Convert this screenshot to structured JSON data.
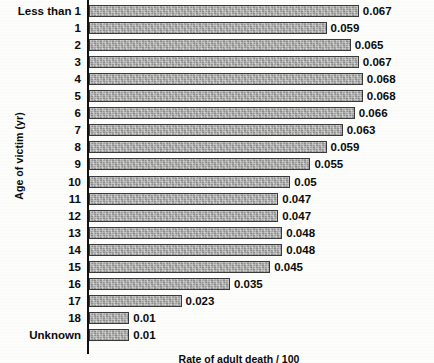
{
  "chart_data": {
    "type": "bar",
    "orientation": "horizontal",
    "title": "",
    "xlabel": "Rate of adult death / 100",
    "ylabel": "Age of victim (yr)",
    "categories": [
      "Less than 1",
      "1",
      "2",
      "3",
      "4",
      "5",
      "6",
      "7",
      "8",
      "9",
      "10",
      "11",
      "12",
      "13",
      "14",
      "15",
      "16",
      "17",
      "18",
      "Unknown"
    ],
    "values": [
      0.067,
      0.059,
      0.065,
      0.067,
      0.068,
      0.068,
      0.066,
      0.063,
      0.059,
      0.055,
      0.05,
      0.047,
      0.047,
      0.048,
      0.048,
      0.045,
      0.035,
      0.023,
      0.01,
      0.01
    ],
    "value_labels": [
      "0.067",
      "0.059",
      "0.065",
      "0.067",
      "0.068",
      "0.068",
      "0.066",
      "0.063",
      "0.059",
      "0.055",
      "0.05",
      "0.047",
      "0.047",
      "0.048",
      "0.048",
      "0.045",
      "0.035",
      "0.023",
      "0.01",
      "0.01"
    ],
    "xlim": [
      0,
      0.0745
    ],
    "grid": false,
    "legend": false,
    "bar_color": "#a7a7a7",
    "bar_border_color": "#3a3a3a",
    "axis_color": "#111111",
    "text_color": "#0b0b0b",
    "background": "#fdfdfb"
  }
}
